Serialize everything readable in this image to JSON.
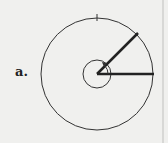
{
  "label": "a.",
  "diagram": {
    "type": "angle-in-standard-position",
    "angle_degrees": 45,
    "rotation_direction": "counterclockwise",
    "circles": [
      "outer-circle",
      "inner-circle"
    ],
    "tick_mark_at_degrees": 90
  }
}
